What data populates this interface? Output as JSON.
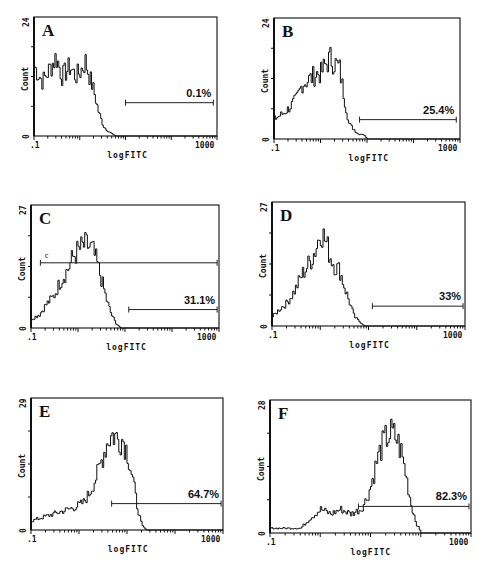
{
  "figure": {
    "x_axis_label": "logFITC",
    "y_axis_label": "Count",
    "x_tick_min": ".1",
    "x_tick_max": "1000"
  },
  "panels": [
    {
      "letter": "A",
      "ymax": "24",
      "ymin": "0",
      "percent": "0.1%",
      "frame": [
        34,
        17,
        217,
        136
      ],
      "gate": [
        0.5,
        0.98,
        0.72
      ],
      "extra_gate": null
    },
    {
      "letter": "B",
      "ymax": "24",
      "ymin": "0",
      "percent": "25.4%",
      "frame": [
        274,
        18,
        460,
        139
      ],
      "gate": [
        0.46,
        0.98,
        0.84
      ],
      "extra_gate": null
    },
    {
      "letter": "C",
      "ymax": "27",
      "ymin": "0",
      "percent": "31.1%",
      "frame": [
        31,
        205,
        219,
        328
      ],
      "gate": [
        0.52,
        0.99,
        0.85
      ],
      "extra_gate": {
        "label": "c",
        "start": 0.05,
        "end": 0.99,
        "level": 0.47
      }
    },
    {
      "letter": "D",
      "ymax": "27",
      "ymin": "0",
      "percent": "33%",
      "frame": [
        272,
        202,
        465,
        326
      ],
      "gate": [
        0.52,
        0.99,
        0.84
      ],
      "extra_gate": null
    },
    {
      "letter": "E",
      "ymax": "29",
      "ymin": "0",
      "percent": "64.7%",
      "frame": [
        31,
        398,
        223,
        530
      ],
      "gate": [
        0.42,
        0.99,
        0.8
      ],
      "extra_gate": null
    },
    {
      "letter": "F",
      "ymax": "28",
      "ymin": "0",
      "percent": "82.3%",
      "frame": [
        270,
        400,
        471,
        533
      ],
      "gate": [
        0.44,
        0.99,
        0.8
      ],
      "extra_gate": null
    }
  ],
  "chart_data": [
    {
      "type": "line",
      "title": "A",
      "xlabel": "logFITC",
      "ylabel": "Count",
      "x_scale": "log",
      "xlim": [
        0.1,
        1000
      ],
      "ylim": [
        0,
        24
      ],
      "x": [
        0.1,
        0.15,
        0.2,
        0.3,
        0.4,
        0.6,
        0.8,
        1.0,
        1.3,
        1.6,
        2.0,
        2.5,
        3.2,
        4.0,
        6,
        10,
        100,
        1000
      ],
      "values": [
        14,
        11,
        13,
        16,
        12,
        14,
        12,
        13,
        15,
        12,
        9,
        5,
        2,
        1,
        0,
        0,
        0,
        0
      ],
      "gate_percent": "0.1%"
    },
    {
      "type": "line",
      "title": "B",
      "xlabel": "logFITC",
      "ylabel": "Count",
      "x_scale": "log",
      "xlim": [
        0.1,
        1000
      ],
      "ylim": [
        0,
        24
      ],
      "x": [
        0.1,
        0.15,
        0.2,
        0.3,
        0.4,
        0.6,
        0.8,
        1.0,
        1.3,
        1.6,
        2.0,
        2.5,
        3.2,
        4.0,
        5.0,
        6.3,
        8,
        10,
        100,
        1000
      ],
      "values": [
        4,
        5,
        6,
        8,
        11,
        12,
        13,
        13,
        15,
        16,
        15,
        14,
        8,
        3,
        2,
        1,
        1,
        0,
        0,
        0
      ],
      "gate_percent": "25.4%"
    },
    {
      "type": "line",
      "title": "C",
      "xlabel": "logFITC",
      "ylabel": "Count",
      "x_scale": "log",
      "xlim": [
        0.1,
        1000
      ],
      "ylim": [
        0,
        27
      ],
      "x": [
        0.1,
        0.15,
        0.2,
        0.3,
        0.4,
        0.6,
        0.8,
        1.0,
        1.3,
        1.6,
        2.0,
        2.5,
        3.2,
        4.0,
        5.0,
        6.3,
        8,
        10,
        100,
        1000
      ],
      "values": [
        2,
        3,
        5,
        7,
        10,
        13,
        16,
        17,
        18,
        18,
        17,
        14,
        10,
        6,
        3,
        1,
        0,
        0,
        0,
        0
      ],
      "gate_percent": "31.1%",
      "extra_gate_label": "c"
    },
    {
      "type": "line",
      "title": "D",
      "xlabel": "logFITC",
      "ylabel": "Count",
      "x_scale": "log",
      "xlim": [
        0.1,
        1000
      ],
      "ylim": [
        0,
        27
      ],
      "x": [
        0.1,
        0.15,
        0.2,
        0.3,
        0.4,
        0.6,
        0.8,
        1.0,
        1.3,
        1.6,
        2.0,
        2.5,
        3.2,
        4.0,
        5.0,
        6.3,
        8,
        10,
        100,
        1000
      ],
      "values": [
        2,
        4,
        5,
        8,
        11,
        14,
        17,
        21,
        18,
        15,
        13,
        12,
        8,
        5,
        2,
        1,
        0,
        0,
        0,
        0
      ],
      "gate_percent": "33%"
    },
    {
      "type": "line",
      "title": "E",
      "xlabel": "logFITC",
      "ylabel": "Count",
      "x_scale": "log",
      "xlim": [
        0.1,
        1000
      ],
      "ylim": [
        0,
        29
      ],
      "x": [
        0.1,
        0.2,
        0.4,
        0.8,
        1.2,
        1.6,
        2.5,
        3.2,
        4.0,
        5.0,
        6.3,
        8,
        10,
        13,
        16,
        20,
        25,
        100,
        1000
      ],
      "values": [
        2,
        3,
        4,
        5,
        6,
        8,
        13,
        17,
        20,
        21,
        20,
        20,
        17,
        11,
        5,
        1,
        0,
        0,
        0
      ],
      "gate_percent": "64.7%"
    },
    {
      "type": "line",
      "title": "F",
      "xlabel": "logFITC",
      "ylabel": "Count",
      "x_scale": "log",
      "xlim": [
        0.1,
        1000
      ],
      "ylim": [
        0,
        28
      ],
      "x": [
        0.1,
        0.2,
        0.4,
        0.6,
        1.0,
        1.6,
        2.5,
        4.0,
        6.3,
        8,
        10,
        13,
        16,
        20,
        25,
        32,
        40,
        50,
        63,
        80,
        100,
        1000
      ],
      "values": [
        1,
        1,
        1,
        3,
        5,
        4,
        5,
        4,
        5,
        7,
        10,
        15,
        18,
        20,
        21,
        20,
        17,
        12,
        6,
        2,
        0,
        0
      ],
      "gate_percent": "82.3%"
    }
  ]
}
